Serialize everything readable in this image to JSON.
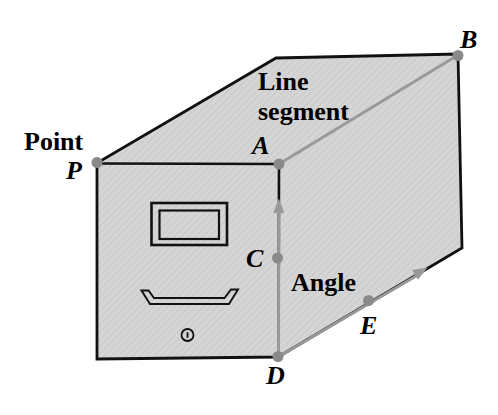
{
  "figure": {
    "concepts": {
      "point_caption": "Point",
      "segment_caption_line1": "Line",
      "segment_caption_line2": "segment",
      "angle_caption": "Angle"
    },
    "points": {
      "p": "P",
      "a": "A",
      "b": "B",
      "c": "C",
      "d": "D",
      "e": "E"
    },
    "colors": {
      "background": "#ffffff",
      "fill": "#d5d5d5",
      "hatch": "#c6c6c6",
      "edge": "#111111",
      "highlight": "#999999",
      "dot": "#8a8a8a",
      "text": "#000000"
    }
  }
}
